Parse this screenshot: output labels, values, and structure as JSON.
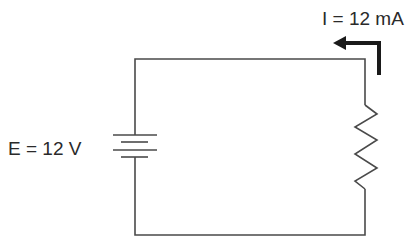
{
  "diagram": {
    "type": "circuit-schematic",
    "components": [
      {
        "kind": "battery",
        "label": "E = 12 V"
      },
      {
        "kind": "resistor"
      },
      {
        "kind": "current-arrow",
        "label": "I = 12 mA",
        "direction": "counterclockwise"
      }
    ],
    "labels": {
      "voltage": "E = 12 V",
      "current": "I = 12 mA"
    },
    "colors": {
      "wire": "#4a4a4a",
      "arrow": "#1a1a1a",
      "text": "#2a2a2a",
      "background": "#ffffff"
    }
  }
}
